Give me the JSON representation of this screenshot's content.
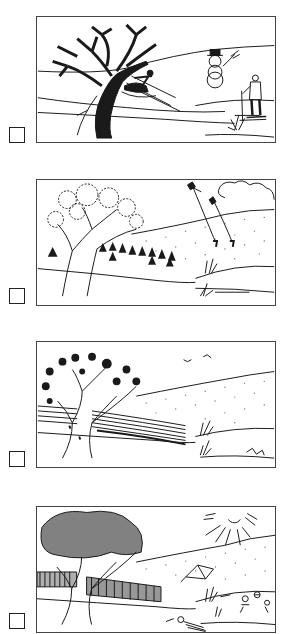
{
  "worksheet": {
    "items": [
      {
        "scene": "winter",
        "description": "Bare tree, child sledding, snowman with top hat and broom, person skiing",
        "checked": false
      },
      {
        "scene": "autumn",
        "description": "Tree with leaves falling, haystacks in field, children flying kites, clouds",
        "checked": false
      },
      {
        "scene": "spring",
        "description": "Tree with blossoms, ploughed field rows, birds flying, small flowers",
        "checked": false
      },
      {
        "scene": "summer",
        "description": "Tree in full leaf, tall corn field, bright sun, tent, children playing with ball",
        "checked": false
      }
    ]
  },
  "colors": {
    "ink": "#1a1a1a",
    "border": "#444444",
    "paper": "#ffffff"
  }
}
